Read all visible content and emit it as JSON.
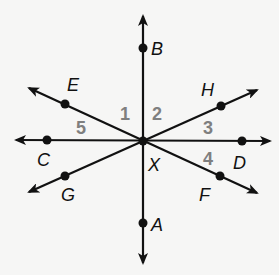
{
  "diagram": {
    "type": "intersecting-lines",
    "center": {
      "name": "X",
      "x": 143,
      "y": 141
    },
    "colors": {
      "lines": "#111111",
      "angle_labels": "#7f7f7f",
      "background": "#f6f6f5"
    },
    "lines": [
      {
        "id": "AB",
        "from": [
          143,
          263
        ],
        "to": [
          143,
          16
        ]
      },
      {
        "id": "CD",
        "from": [
          16,
          140
        ],
        "to": [
          270,
          141
        ]
      },
      {
        "id": "EF",
        "from": [
          29,
          88
        ],
        "to": [
          257,
          193
        ]
      },
      {
        "id": "GH",
        "from": [
          29,
          192
        ],
        "to": [
          257,
          90
        ]
      }
    ],
    "points": [
      {
        "name": "B",
        "x": 143,
        "y": 48,
        "label_x": 151,
        "label_y": 55
      },
      {
        "name": "A",
        "x": 143,
        "y": 223,
        "label_x": 151,
        "label_y": 231
      },
      {
        "name": "C",
        "x": 47,
        "y": 140,
        "label_x": 37,
        "label_y": 166
      },
      {
        "name": "D",
        "x": 242,
        "y": 141,
        "label_x": 233,
        "label_y": 169
      },
      {
        "name": "E",
        "x": 65,
        "y": 104,
        "label_x": 67,
        "label_y": 91
      },
      {
        "name": "F",
        "x": 220,
        "y": 176,
        "label_x": 199,
        "label_y": 201
      },
      {
        "name": "G",
        "x": 65,
        "y": 176,
        "label_x": 61,
        "label_y": 201
      },
      {
        "name": "H",
        "x": 221,
        "y": 106,
        "label_x": 201,
        "label_y": 96
      }
    ],
    "center_label": {
      "text": "X",
      "x": 148,
      "y": 171
    },
    "angle_labels": [
      {
        "text": "1",
        "x": 120,
        "y": 120
      },
      {
        "text": "2",
        "x": 152,
        "y": 120
      },
      {
        "text": "3",
        "x": 203,
        "y": 134
      },
      {
        "text": "4",
        "x": 203,
        "y": 165
      },
      {
        "text": "5",
        "x": 76,
        "y": 134
      }
    ]
  }
}
